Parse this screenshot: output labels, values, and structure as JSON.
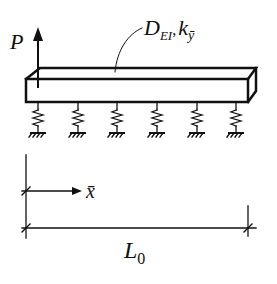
{
  "diagram": {
    "type": "beam-on-elastic-foundation",
    "load_label": "P",
    "beam_label": {
      "main1": "D",
      "sub1": "EI",
      "separator": ",",
      "main2": "k",
      "sub2": "ȳ"
    },
    "coordinate_label": "x̄",
    "length_label": {
      "main": "L",
      "sub": "0"
    },
    "spring_count": 6,
    "colors": {
      "line": "#111111",
      "background": "#ffffff"
    }
  }
}
